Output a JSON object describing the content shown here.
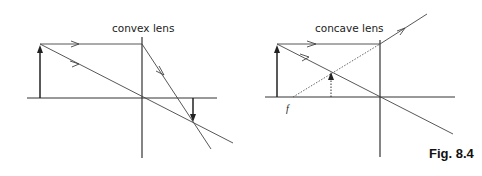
{
  "figure": {
    "caption": "Fig. 8.4",
    "panels": [
      {
        "id": "convex",
        "title": "convex lens",
        "description": "Object arrow left of a convex lens; parallel ray refracts through focal point, central ray passes undeviated; real inverted image forms where rays cross."
      },
      {
        "id": "concave",
        "title": "concave lens",
        "focal_label": "f",
        "description": "Object arrow left of a concave lens; parallel ray diverges as if from focal point f (dotted construction line); central ray passes undeviated; virtual upright diminished image shown dotted."
      }
    ]
  },
  "colors": {
    "line": "#333333",
    "text": "#222222",
    "background": "#ffffff"
  }
}
